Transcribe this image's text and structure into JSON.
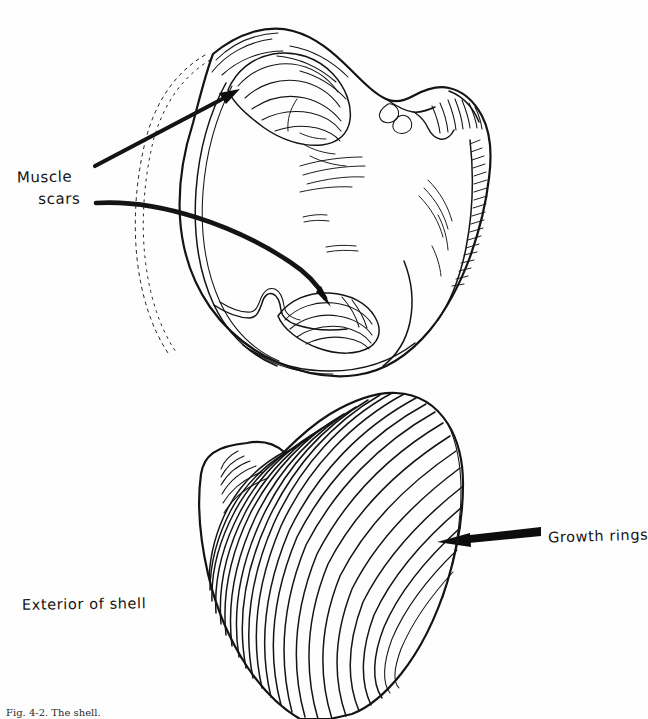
{
  "figure": {
    "domain": "scientific-illustration",
    "style": "hand-drawn pen and ink line drawing",
    "background_color": "#ffffff",
    "ink_color": "#141414",
    "caption": "Fig. 4-2. The shell.",
    "canvas": {
      "width": 647,
      "height": 719
    }
  },
  "labels": {
    "muscle_scars_line1": "Muscle",
    "muscle_scars_line2": "scars",
    "growth_rings": "Growth rings",
    "exterior_of_shell": "Exterior of shell"
  },
  "views": {
    "interior": {
      "name": "interior-of-shell",
      "bounds": {
        "x": 150,
        "y": 25,
        "width": 340,
        "height": 350
      },
      "features": [
        "anterior-muscle-scar",
        "posterior-muscle-scar",
        "pallial-line",
        "hinge-teeth",
        "ligament",
        "crenulated-margin"
      ]
    },
    "exterior": {
      "name": "exterior-of-shell",
      "bounds": {
        "x": 195,
        "y": 390,
        "width": 260,
        "height": 315
      },
      "umbo": {
        "x": 207,
        "y": 455
      },
      "growth_ring_count": 22,
      "clipped_at_bottom": true
    }
  },
  "annotations": [
    {
      "name": "arrow-to-anterior-muscle-scar",
      "target_label": "Muscle scars",
      "from": {
        "x": 95,
        "y": 166
      },
      "to": {
        "x": 237,
        "y": 91
      },
      "shape": "straight"
    },
    {
      "name": "arrow-to-posterior-muscle-scar",
      "target_label": "Muscle scars",
      "from": {
        "x": 96,
        "y": 203
      },
      "to": {
        "x": 329,
        "y": 304
      },
      "shape": "curved"
    },
    {
      "name": "arrow-to-growth-rings",
      "target_label": "Growth rings",
      "from": {
        "x": 540,
        "y": 531
      },
      "to": {
        "x": 437,
        "y": 542
      },
      "shape": "straight-tapered"
    }
  ]
}
